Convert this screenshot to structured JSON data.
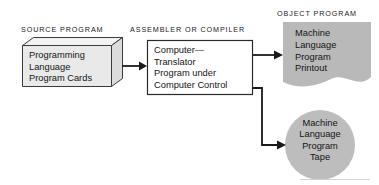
{
  "diagram": {
    "background_color": "#ffffff",
    "captions": {
      "source": "SOURCE PROGRAM",
      "assembler": "ASSEMBLER OR COMPILER",
      "object": "OBJECT PROGRAM"
    },
    "nodes": {
      "source_cards": {
        "shape": "cube",
        "fill_color": "#e9e9e9",
        "stroke_color": "#3a3a3a",
        "lines": [
          "Programming",
          "Language",
          "Program Cards"
        ]
      },
      "translator": {
        "shape": "rectangle",
        "fill_color": "#ffffff",
        "stroke_color": "#2a2a2a",
        "lines": [
          "Computer—",
          "Translator",
          "Program under",
          "Computer Control"
        ]
      },
      "printout": {
        "shape": "document",
        "fill_color": "#b9b9b9",
        "stroke_color": "#b9b9b9",
        "lines": [
          "Machine",
          "Language",
          "Program",
          "Printout"
        ]
      },
      "tape": {
        "shape": "circle",
        "fill_color": "#bdbdbd",
        "stroke_color": "#bdbdbd",
        "lines": [
          "Machine",
          "Language",
          "Program",
          "Tape"
        ]
      }
    },
    "connectors": [
      {
        "name": "cards-to-translator",
        "from": "source_cards",
        "to": "translator",
        "style": "straight-arrow",
        "color": "#1a1a1a"
      },
      {
        "name": "translator-to-printout",
        "from": "translator",
        "to": "printout",
        "style": "straight-arrow",
        "color": "#1a1a1a"
      },
      {
        "name": "translator-to-tape",
        "from": "translator",
        "to": "tape",
        "style": "elbow-arrow",
        "color": "#1a1a1a"
      }
    ]
  }
}
